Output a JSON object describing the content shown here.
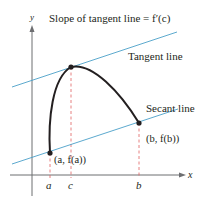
{
  "figure": {
    "title": "Slope of tangent line = f′(c)",
    "tangent_label": "Tangent line",
    "secant_label": "Secant line",
    "point_a_label": "(a, f(a))",
    "point_b_label": "(b, f(b))",
    "x_axis_label": "x",
    "y_axis_label": "y",
    "ticks": {
      "a": "a",
      "c": "c",
      "b": "b"
    },
    "colors": {
      "curve": "#231f20",
      "tangent_line": "#4a9fc8",
      "secant_line": "#4a9fc8",
      "guide_lines": "#e06060",
      "axes": "#6d6e71"
    }
  }
}
